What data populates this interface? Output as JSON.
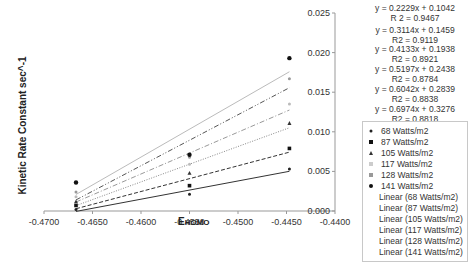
{
  "chart_data": {
    "type": "scatter",
    "title": "",
    "xlabel": "EHOMO",
    "xlabel_main": "E",
    "xlabel_sub": "HOMO",
    "ylabel": "Kinetic Rate Constant sec^-1",
    "xlim": [
      -0.47,
      -0.44
    ],
    "ylim": [
      0.0,
      0.025
    ],
    "x_ticks": [
      "-0.4700",
      "-0.4650",
      "-0.4600",
      "-0.4550",
      "-0.4500",
      "-0.4450",
      "-0.4400"
    ],
    "y_ticks": [
      "0.000",
      "0.005",
      "0.010",
      "0.015",
      "0.020",
      "0.025"
    ],
    "y_axis_position": "right",
    "grid": false,
    "legend_position": "right",
    "x": [
      -0.4667,
      -0.455,
      -0.4447
    ],
    "series": [
      {
        "name": "68 Watts/m2",
        "marker": "dot",
        "color": "#222222",
        "values": [
          0.0002,
          0.0021,
          0.0053
        ],
        "trendline": {
          "name": "Linear (68 Watts/m2)",
          "style": "solid",
          "color": "#333333",
          "equation": "y = 0.2229x + 0.1042",
          "r2": "R 2 = 0.9467",
          "slope": 0.2229,
          "intercept": 0.1042
        }
      },
      {
        "name": "87 Watts/m2",
        "marker": "square",
        "color": "#111111",
        "values": [
          0.0007,
          0.0032,
          0.0079
        ],
        "trendline": {
          "name": "Linear (87 Watts/m2)",
          "style": "dashed",
          "color": "#333333",
          "equation": "y = 0.3114x + 0.1459",
          "r2": "R2 = 0.9119",
          "slope": 0.3114,
          "intercept": 0.1459
        }
      },
      {
        "name": "105 Watts/m2",
        "marker": "triangle",
        "color": "#333333",
        "values": [
          0.0012,
          0.0048,
          0.0111
        ],
        "trendline": {
          "name": "Linear (105 Watts/m2)",
          "style": "dotted",
          "color": "#888888",
          "equation": "y = 0.4133x + 0.1938",
          "r2": "R2 = 0.8921",
          "slope": 0.4133,
          "intercept": 0.1938
        }
      },
      {
        "name": "117 Watts/m2",
        "marker": "x",
        "color": "#bbbbbb",
        "values": [
          0.0018,
          0.0059,
          0.0135
        ],
        "trendline": {
          "name": "Linear (117 Watts/m2)",
          "style": "dashdot",
          "color": "#999999",
          "equation": "y = 0.5197x + 0.2438",
          "r2": "R2 = 0.8784",
          "slope": 0.5197,
          "intercept": 0.2438
        }
      },
      {
        "name": "128 Watts/m2",
        "marker": "star",
        "color": "#999999",
        "values": [
          0.0024,
          0.0068,
          0.0167
        ],
        "trendline": {
          "name": "Linear (128 Watts/m2)",
          "style": "dashdotdot",
          "color": "#555555",
          "equation": "y = 0.6042x + 0.2839",
          "r2": "R2 = 0.8838",
          "slope": 0.6042,
          "intercept": 0.2839
        }
      },
      {
        "name": "141 Watts/m2",
        "marker": "circle",
        "color": "#111111",
        "values": [
          0.0036,
          0.0071,
          0.0193
        ],
        "trendline": {
          "name": "Linear (141 Watts/m2)",
          "style": "solid",
          "color": "#bbbbbb",
          "equation": "y = 0.6974x + 0.3276",
          "r2": "R2 = 0.8818",
          "slope": 0.6974,
          "intercept": 0.3276
        }
      }
    ]
  },
  "equations": [
    {
      "eq": "y = 0.2229x + 0.1042",
      "r2": "R 2 = 0.9467"
    },
    {
      "eq": "y = 0.3114x + 0.1459",
      "r2": "R2 = 0.9119"
    },
    {
      "eq": "y = 0.4133x + 0.1938",
      "r2": "R2 = 0.8921"
    },
    {
      "eq": "y = 0.5197x + 0.2438",
      "r2": "R2 = 0.8784"
    },
    {
      "eq": "y = 0.6042x + 0.2839",
      "r2": "R2 = 0.8838"
    },
    {
      "eq": "y = 0.6974x + 0.3276",
      "r2": "R2 = 0.8818"
    }
  ],
  "legend": {
    "markers": [
      "68 Watts/m2",
      "87 Watts/m2",
      "105 Watts/m2",
      "117 Watts/m2",
      "128 Watts/m2",
      "141 Watts/m2"
    ],
    "lines": [
      "Linear (68 Watts/m2)",
      "Linear (87 Watts/m2)",
      "Linear (105 Watts/m2)",
      "Linear (117 Watts/m2)",
      "Linear (128 Watts/m2)",
      "Linear (141 Watts/m2)"
    ]
  }
}
